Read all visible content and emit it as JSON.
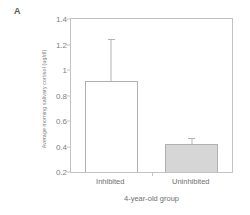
{
  "figure": {
    "panel_label": "A"
  },
  "chart_data": {
    "type": "bar",
    "title": "",
    "subtitle": "",
    "xlabel": "4-year-old group",
    "ylabel": "Average morning salivary cortisol (ug/dl)",
    "categories": [
      "Inhibited",
      "Uninhibited"
    ],
    "values": [
      0.91,
      0.42
    ],
    "errors_upper": [
      1.24,
      0.47
    ],
    "error_bar_type": "upper-only",
    "bar_styles": [
      "open",
      "filled"
    ],
    "ylim": [
      0.2,
      1.4
    ],
    "yticks": [
      0.2,
      0.4,
      0.6,
      0.8,
      1,
      1.2,
      1.4
    ],
    "ytick_labels": [
      "0.2",
      "0.4",
      "0.6",
      "0.8",
      "1",
      "1.2",
      "1.4"
    ],
    "grid": false,
    "legend": "none",
    "colors": {
      "bar_open_fill": "#ffffff",
      "bar_filled_fill": "#d6d6d6",
      "bar_edge": "#b0b0b0",
      "axis": "#c3c3c3",
      "text": "#6f6f6f"
    }
  }
}
